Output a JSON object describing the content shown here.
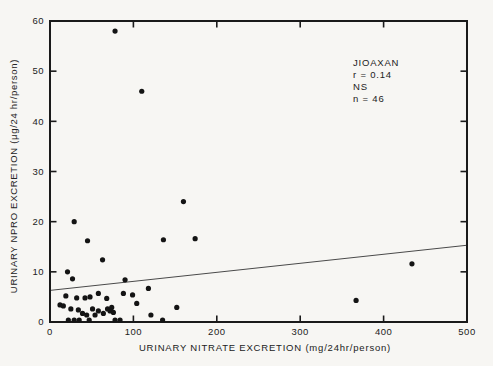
{
  "figure": {
    "background": "#f7f6f3",
    "ink": "#1a1a1a",
    "point_color": "#141414",
    "line_color": "#4a4a4a"
  },
  "chart_data": {
    "type": "scatter",
    "title": "",
    "xlabel": "URINARY NITRATE EXCRETION (mg/24hr/person)",
    "ylabel": "URINARY NPRO EXCRETION (μg/24 hr/person)",
    "xlim": [
      0,
      500
    ],
    "ylim": [
      0,
      60
    ],
    "xticks": [
      0,
      100,
      200,
      300,
      400,
      500
    ],
    "yticks": [
      0,
      10,
      20,
      30,
      40,
      50,
      60
    ],
    "grid": false,
    "legend_position": "top-right-inside",
    "annotation": {
      "label": "JIOAXAN",
      "r": "r = 0.14",
      "sig": "NS",
      "n": "n = 46"
    },
    "regression_line": {
      "x": [
        0,
        500
      ],
      "y": [
        6.3,
        15.3
      ]
    },
    "points": [
      [
        78,
        58
      ],
      [
        110,
        46
      ],
      [
        160,
        24
      ],
      [
        136,
        16.4
      ],
      [
        174,
        16.6
      ],
      [
        29,
        20
      ],
      [
        45,
        16.2
      ],
      [
        63,
        12.4
      ],
      [
        21,
        10
      ],
      [
        27,
        8.6
      ],
      [
        90,
        8.4
      ],
      [
        434,
        11.6
      ],
      [
        367,
        4.3
      ],
      [
        118,
        6.7
      ],
      [
        88,
        5.7
      ],
      [
        99,
        5.4
      ],
      [
        104,
        3.7
      ],
      [
        152,
        2.9
      ],
      [
        121,
        1.4
      ],
      [
        19,
        5.2
      ],
      [
        32,
        4.8
      ],
      [
        42,
        4.8
      ],
      [
        48,
        5.0
      ],
      [
        58,
        5.7
      ],
      [
        68,
        4.7
      ],
      [
        12,
        3.4
      ],
      [
        16,
        3.2
      ],
      [
        25,
        2.6
      ],
      [
        34,
        2.4
      ],
      [
        39,
        1.7
      ],
      [
        44,
        1.4
      ],
      [
        51,
        2.6
      ],
      [
        54,
        1.4
      ],
      [
        58,
        2.2
      ],
      [
        64,
        1.7
      ],
      [
        69,
        2.6
      ],
      [
        72,
        2.2
      ],
      [
        74,
        2.9
      ],
      [
        76,
        1.9
      ],
      [
        22,
        0.4
      ],
      [
        29,
        0.4
      ],
      [
        35,
        0.4
      ],
      [
        47,
        0.4
      ],
      [
        78,
        0.4
      ],
      [
        84,
        0.4
      ],
      [
        135,
        0.4
      ]
    ]
  }
}
